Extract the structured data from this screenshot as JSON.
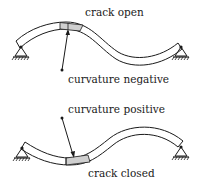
{
  "diagram": {
    "top": {
      "label_top": "crack open",
      "label_bottom": "curvature negative"
    },
    "bottom": {
      "label_top": "curvature positive",
      "label_bottom": "crack closed"
    },
    "colors": {
      "line": "#1a1a1a",
      "crack_fill": "#cfcfcf",
      "background": "#ffffff"
    }
  }
}
